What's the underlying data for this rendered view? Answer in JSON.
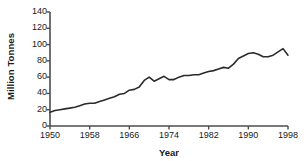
{
  "chart_data": {
    "type": "line",
    "title": "",
    "xlabel": "Year",
    "ylabel": "Million Tonnes",
    "xlim": [
      1950,
      1998
    ],
    "ylim": [
      0,
      140
    ],
    "grid": false,
    "legend": null,
    "xticks": [
      1950,
      1958,
      1966,
      1974,
      1982,
      1990,
      1998
    ],
    "yticks": [
      0,
      20,
      40,
      60,
      80,
      100,
      120,
      140
    ],
    "line_color": "#2b2b2b",
    "axis_color": "#4d4d4d",
    "series": [
      {
        "name": "World production",
        "x": [
          1950,
          1951,
          1952,
          1953,
          1954,
          1955,
          1956,
          1957,
          1958,
          1959,
          1960,
          1961,
          1962,
          1963,
          1964,
          1965,
          1966,
          1967,
          1968,
          1969,
          1970,
          1971,
          1972,
          1973,
          1974,
          1975,
          1976,
          1977,
          1978,
          1979,
          1980,
          1981,
          1982,
          1983,
          1984,
          1985,
          1986,
          1987,
          1988,
          1989,
          1990,
          1991,
          1992,
          1993,
          1994,
          1995,
          1996,
          1997,
          1998
        ],
        "values": [
          17,
          19,
          20,
          21,
          22,
          23,
          25,
          27,
          28,
          28,
          30,
          32,
          34,
          36,
          39,
          40,
          44,
          45,
          48,
          56,
          60,
          55,
          58,
          61,
          57,
          57,
          60,
          62,
          62,
          63,
          63,
          65,
          67,
          68,
          70,
          72,
          71,
          76,
          83,
          86,
          89,
          90,
          88,
          85,
          85,
          87,
          91,
          95,
          87
        ]
      }
    ]
  },
  "axis_labels": {
    "y_title": "Million Tonnes",
    "x_title": "Year"
  }
}
